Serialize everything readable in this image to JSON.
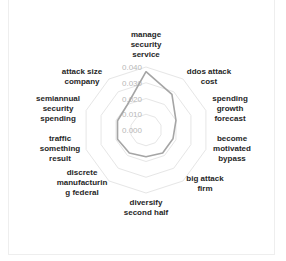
{
  "chart_data": {
    "type": "radar",
    "title": "",
    "categories": [
      "manage security service",
      "ddos attack cost",
      "spending growth forecast",
      "become motivated bypass",
      "big attack firm",
      "diversify second half",
      "discrete manufacturing federal",
      "traffic something result",
      "semiannual security spending",
      "attack size company"
    ],
    "category_label_lines": [
      [
        "manage",
        "security",
        "service"
      ],
      [
        "ddos attack",
        "cost"
      ],
      [
        "spending",
        "growth",
        "forecast"
      ],
      [
        "become",
        "motivated",
        "bypass"
      ],
      [
        "big attack",
        "firm"
      ],
      [
        "diversify",
        "second half"
      ],
      [
        "discrete",
        "manufacturin",
        "g federal"
      ],
      [
        "traffic",
        "something",
        "result"
      ],
      [
        "semiannual",
        "security",
        "spending"
      ],
      [
        "attack size",
        "company"
      ]
    ],
    "series": [
      {
        "name": "Series 1",
        "values": [
          0.037,
          0.028,
          0.02,
          0.018,
          0.018,
          0.017,
          0.018,
          0.019,
          0.019,
          0.02
        ],
        "color": "#a5a5a5"
      }
    ],
    "rlim": [
      0.0,
      0.04
    ],
    "ticks": [
      "0.000",
      "0.010",
      "0.020",
      "0.030",
      "0.040"
    ],
    "grid": true,
    "grid_color": "#e6e6e6",
    "legend": "none"
  }
}
